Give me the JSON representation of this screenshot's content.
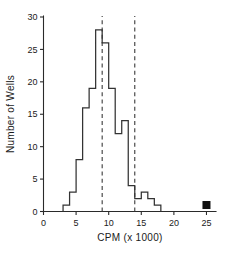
{
  "chart_data": {
    "type": "bar",
    "title": "",
    "xlabel": "CPM (x 1000)",
    "ylabel": "Number of Wells",
    "xlim": [
      0,
      26
    ],
    "ylim": [
      0,
      30
    ],
    "xticks": [
      0,
      5,
      10,
      15,
      20,
      25
    ],
    "xtick_labels": [
      "0",
      "5",
      "10",
      "15",
      "20",
      "25"
    ],
    "yticks": [
      0,
      5,
      10,
      15,
      20,
      25,
      30
    ],
    "ytick_labels": [
      "0",
      "5",
      "10",
      "15",
      "20",
      "25",
      "30"
    ],
    "grid": false,
    "legend": null,
    "bin_width": 1,
    "bin_starts": [
      3,
      4,
      5,
      6,
      7,
      8,
      9,
      10,
      11,
      12,
      13,
      14,
      15,
      16,
      17
    ],
    "categories": [
      "3-4",
      "4-5",
      "5-6",
      "6-7",
      "7-8",
      "8-9",
      "9-10",
      "10-11",
      "11-12",
      "12-13",
      "13-14",
      "14-15",
      "15-16",
      "16-17",
      "17-18"
    ],
    "values": [
      1,
      3,
      8,
      16,
      19,
      28,
      26,
      19,
      12,
      14,
      4,
      2,
      3,
      2,
      1
    ],
    "annotations": [
      {
        "kind": "vline",
        "label": "lower cutoff",
        "x": 9,
        "style": "dashed"
      },
      {
        "kind": "vline",
        "label": "upper cutoff",
        "x": 14,
        "style": "dashed"
      },
      {
        "kind": "point-marker",
        "label": "outlier well",
        "x": 25,
        "y": 1,
        "shape": "filled-square"
      }
    ]
  },
  "axes": {
    "x_title": "CPM (x 1000)",
    "y_title": "Number of Wells"
  },
  "colors": {
    "line": "#333333",
    "axis": "#2a2a2a",
    "dashed": "#3a3a3a",
    "marker": "#111111",
    "background": "#ffffff"
  }
}
